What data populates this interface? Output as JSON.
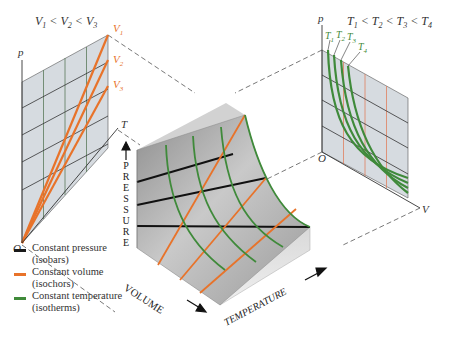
{
  "left_panel": {
    "title": "V1 < V2 < V3",
    "title_parts": [
      "V",
      "1",
      " < ",
      "V",
      "2",
      " < ",
      "V",
      "3"
    ],
    "axis_y": "p",
    "axis_x": "T",
    "origin": "O",
    "curve_labels": [
      {
        "base": "V",
        "sub": "1"
      },
      {
        "base": "V",
        "sub": "2"
      },
      {
        "base": "V",
        "sub": "3"
      }
    ]
  },
  "right_panel": {
    "title": "T1 < T2 < T3 < T4",
    "axis_y": "p",
    "axis_x": "V",
    "origin": "O",
    "curve_labels": [
      {
        "base": "T",
        "sub": "1"
      },
      {
        "base": "T",
        "sub": "2"
      },
      {
        "base": "T",
        "sub": "3"
      },
      {
        "base": "T",
        "sub": "4"
      }
    ]
  },
  "surface": {
    "axis_pressure": "PRESSURE",
    "axis_volume": "VOLUME",
    "axis_temperature": "TEMPERATURE"
  },
  "legend": [
    {
      "label": "Constant pressure",
      "sub": "(isobars)",
      "color": "#1a1a1a"
    },
    {
      "label": "Constant volume",
      "sub": "(isochors)",
      "color": "#e8732a"
    },
    {
      "label": "Constant temperature",
      "sub": "(isotherms)",
      "color": "#3f8a3a"
    }
  ],
  "colors": {
    "isobar": "#1a1a1a",
    "isochor": "#e8732a",
    "isotherm": "#3f8a3a",
    "label_orange": "#e8732a",
    "label_green": "#3f8a3a"
  }
}
